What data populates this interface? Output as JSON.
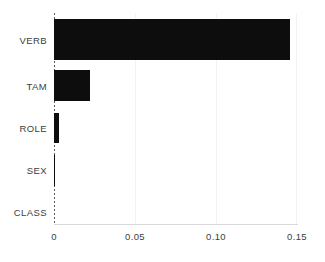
{
  "chart_data": {
    "type": "bar",
    "orientation": "horizontal",
    "title": "",
    "xlabel": "",
    "ylabel": "",
    "categories": [
      "VERB",
      "TAM",
      "ROLE",
      "SEX",
      "CLASS"
    ],
    "values": [
      0.1455,
      0.0222,
      0.0028,
      0.0006,
      0.0
    ],
    "xlim": [
      0,
      0.15
    ],
    "xticks": [
      0,
      0.05,
      0.1,
      0.15
    ],
    "xticklabels": [
      "0",
      "0.05",
      "0.10",
      "0.15"
    ],
    "grid": true,
    "grid_axis": "x",
    "legend": null,
    "bar_color": "#0d0d0d",
    "gridline_color": "#f2f2f3",
    "zero_line_color": "#5a5a5a",
    "zero_line_style": "dashed",
    "axis_line_color": "#d9d9dc",
    "tick_label_color": "#3d3d3d",
    "background_color": "#ffffff"
  },
  "axis": {
    "x": {
      "ticks": [
        {
          "label": "0",
          "value": 0.0
        },
        {
          "label": "0.05",
          "value": 0.05
        },
        {
          "label": "0.10",
          "value": 0.1
        },
        {
          "label": "0.15",
          "value": 0.15
        }
      ]
    },
    "y": {
      "ticks": [
        {
          "label": "VERB"
        },
        {
          "label": "TAM"
        },
        {
          "label": "ROLE"
        },
        {
          "label": "SEX"
        },
        {
          "label": "CLASS"
        }
      ]
    }
  }
}
